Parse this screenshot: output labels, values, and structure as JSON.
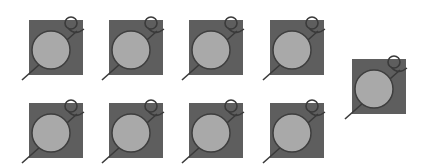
{
  "colors": {
    "background": "#ffffff",
    "square": "#5e5e5e",
    "circle_fill": "#a9a9a9",
    "circle_stroke": "#3e3e3e",
    "pin": "#3a3a3a"
  },
  "tiles": [
    {
      "id": "tile-1",
      "x": 29,
      "y": 20,
      "icon": "magnifier-pin-icon"
    },
    {
      "id": "tile-2",
      "x": 109,
      "y": 20,
      "icon": "magnifier-pin-icon"
    },
    {
      "id": "tile-3",
      "x": 189,
      "y": 20,
      "icon": "magnifier-pin-icon"
    },
    {
      "id": "tile-4",
      "x": 270,
      "y": 20,
      "icon": "magnifier-pin-icon"
    },
    {
      "id": "tile-5",
      "x": 352,
      "y": 59,
      "icon": "magnifier-pin-icon"
    },
    {
      "id": "tile-6",
      "x": 29,
      "y": 103,
      "icon": "magnifier-pin-icon"
    },
    {
      "id": "tile-7",
      "x": 109,
      "y": 103,
      "icon": "magnifier-pin-icon"
    },
    {
      "id": "tile-8",
      "x": 189,
      "y": 103,
      "icon": "magnifier-pin-icon"
    },
    {
      "id": "tile-9",
      "x": 270,
      "y": 103,
      "icon": "magnifier-pin-icon"
    }
  ]
}
